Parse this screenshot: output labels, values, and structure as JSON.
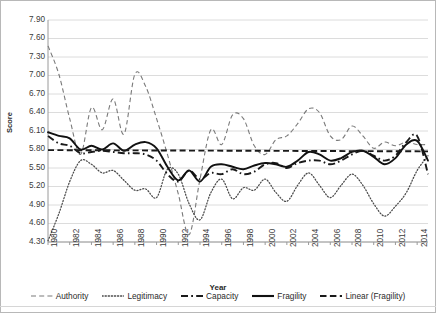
{
  "chart_data": {
    "type": "line",
    "title": "",
    "xlabel": "Year",
    "ylabel": "Score",
    "xlim": [
      1980,
      2015
    ],
    "ylim": [
      4.3,
      7.9
    ],
    "ytick_step": 0.3,
    "grid": "horizontal",
    "legend_position": "bottom",
    "yticks": [
      "7.90",
      "7.60",
      "7.30",
      "7.00",
      "6.70",
      "6.40",
      "6.10",
      "5.80",
      "5.50",
      "5.20",
      "4.90",
      "4.60",
      "4.30"
    ],
    "xticks": [
      "1980",
      "1982",
      "1984",
      "1986",
      "1988",
      "1990",
      "1992",
      "1994",
      "1996",
      "1998",
      "2000",
      "2002",
      "2004",
      "2006",
      "2008",
      "2010",
      "2012",
      "2014"
    ],
    "x": [
      1980,
      1981,
      1982,
      1983,
      1984,
      1985,
      1986,
      1987,
      1988,
      1989,
      1990,
      1991,
      1992,
      1993,
      1994,
      1995,
      1996,
      1997,
      1998,
      1999,
      2000,
      2001,
      2002,
      2003,
      2004,
      2005,
      2006,
      2007,
      2008,
      2009,
      2010,
      2011,
      2012,
      2013,
      2014,
      2015
    ],
    "series": [
      {
        "name": "Authority",
        "style": "dashed",
        "color": "#7a7a7a",
        "values": [
          7.48,
          7.02,
          6.3,
          5.72,
          6.48,
          6.12,
          6.62,
          6.05,
          7.02,
          6.82,
          6.3,
          5.72,
          5.08,
          4.42,
          5.32,
          6.12,
          5.88,
          6.36,
          6.3,
          5.86,
          5.72,
          5.96,
          6.02,
          6.22,
          6.46,
          6.4,
          6.02,
          5.96,
          6.18,
          6.02,
          5.82,
          5.92,
          5.86,
          5.92,
          5.88,
          5.88
        ]
      },
      {
        "name": "Legitimacy",
        "style": "dotted",
        "color": "#4a4a4a",
        "values": [
          4.32,
          4.76,
          5.28,
          5.62,
          5.56,
          5.42,
          5.46,
          5.3,
          5.14,
          5.16,
          5.02,
          5.48,
          5.4,
          4.92,
          4.66,
          5.1,
          5.32,
          5.0,
          5.18,
          5.14,
          5.32,
          5.1,
          4.96,
          5.22,
          5.42,
          5.22,
          5.02,
          5.22,
          5.4,
          5.22,
          4.92,
          4.72,
          4.88,
          5.1,
          5.46,
          5.7
        ]
      },
      {
        "name": "Capacity",
        "style": "dashdot",
        "color": "#1a1a1a",
        "values": [
          6.02,
          5.9,
          5.86,
          5.74,
          5.76,
          5.78,
          5.76,
          5.74,
          5.74,
          5.72,
          5.62,
          5.4,
          5.28,
          5.46,
          5.32,
          5.42,
          5.4,
          5.48,
          5.4,
          5.44,
          5.56,
          5.58,
          5.5,
          5.58,
          5.62,
          5.62,
          5.56,
          5.62,
          5.72,
          5.78,
          5.7,
          5.62,
          5.7,
          5.92,
          6.02,
          5.4
        ]
      },
      {
        "name": "Fragility",
        "style": "solid",
        "color": "#111111",
        "values": [
          6.08,
          6.02,
          5.98,
          5.8,
          5.86,
          5.8,
          5.9,
          5.78,
          5.88,
          5.92,
          5.82,
          5.52,
          5.3,
          5.46,
          5.28,
          5.52,
          5.56,
          5.52,
          5.48,
          5.54,
          5.58,
          5.56,
          5.52,
          5.62,
          5.76,
          5.72,
          5.62,
          5.66,
          5.76,
          5.78,
          5.68,
          5.56,
          5.66,
          5.88,
          5.94,
          5.62
        ]
      },
      {
        "name": "Linear (Fragility)",
        "style": "dashed-bold",
        "color": "#1a1a1a",
        "values": [
          5.78,
          5.78,
          5.78,
          5.78,
          5.78,
          5.78,
          5.78,
          5.78,
          5.78,
          5.78,
          5.78,
          5.78,
          5.78,
          5.78,
          5.78,
          5.78,
          5.78,
          5.78,
          5.78,
          5.78,
          5.78,
          5.78,
          5.78,
          5.78,
          5.78,
          5.78,
          5.78,
          5.78,
          5.78,
          5.78,
          5.78,
          5.78,
          5.78,
          5.78,
          5.78,
          5.78
        ],
        "trend_from": 5.79,
        "trend_to": 5.77
      }
    ]
  },
  "legend": [
    {
      "label": "Authority",
      "icon": "dashed-line-icon"
    },
    {
      "label": "Legitimacy",
      "icon": "dotted-line-icon"
    },
    {
      "label": "Capacity",
      "icon": "dashdot-line-icon"
    },
    {
      "label": "Fragility",
      "icon": "solid-line-icon"
    },
    {
      "label": "Linear (Fragility)",
      "icon": "dashed-bold-line-icon"
    }
  ]
}
